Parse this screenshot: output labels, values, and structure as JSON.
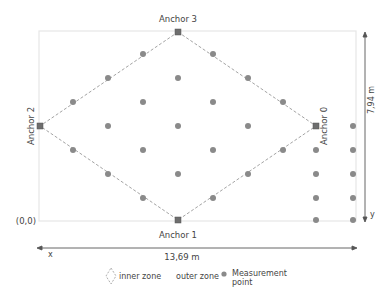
{
  "diagram": {
    "anchors": [
      {
        "label": "Anchor 0",
        "x": 316,
        "y": 126
      },
      {
        "label": "Anchor 1",
        "x": 178,
        "y": 220
      },
      {
        "label": "Anchor 2",
        "x": 40,
        "y": 126
      },
      {
        "label": "Anchor 3",
        "x": 178,
        "y": 32
      }
    ],
    "origin_label": "(0,0)",
    "x_axis": {
      "label": "x",
      "dimension": "13,69 m"
    },
    "y_axis": {
      "label": "y",
      "dimension": "7,94 m"
    },
    "legend": {
      "inner_zone": "inner zone",
      "outer_zone": "outer zone",
      "measurement_point_line1": "Measurement",
      "measurement_point_line2": "point"
    },
    "colors": {
      "point": "#8a8a8a",
      "anchor": "#6e6e6e",
      "dash": "#9a9a9a",
      "border": "#e4e4e4",
      "arrow": "#555555"
    }
  }
}
